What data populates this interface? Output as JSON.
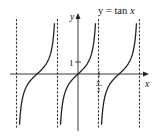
{
  "chart_data": {
    "type": "line",
    "title": "y = tan x",
    "xlabel": "x",
    "ylabel": "y",
    "function": "tan(x)",
    "x_range": [
      -4.7,
      4.4
    ],
    "y_range": [
      -4.7,
      5.1
    ],
    "ticks": {
      "x": [
        {
          "value": 1.5708,
          "label": "π/2"
        }
      ],
      "y": [
        {
          "value": 1,
          "label": "1"
        }
      ]
    },
    "asymptotes_x": [
      -4.7124,
      -1.5708,
      1.5708,
      4.7124
    ],
    "asymptote_style": "dashed",
    "branches": [
      {
        "center": -3.1416,
        "from": -4.6,
        "to": -1.68
      },
      {
        "center": 0,
        "from": -1.46,
        "to": 1.46
      },
      {
        "center": 3.1416,
        "from": 1.68,
        "to": 4.6
      }
    ],
    "grid": false,
    "legend": "none"
  },
  "labels": {
    "title": "y = tan ",
    "title_var": "x",
    "x_axis": "x",
    "y_axis": "y",
    "y_tick": "1",
    "x_tick_num": "π",
    "x_tick_den": "2"
  }
}
